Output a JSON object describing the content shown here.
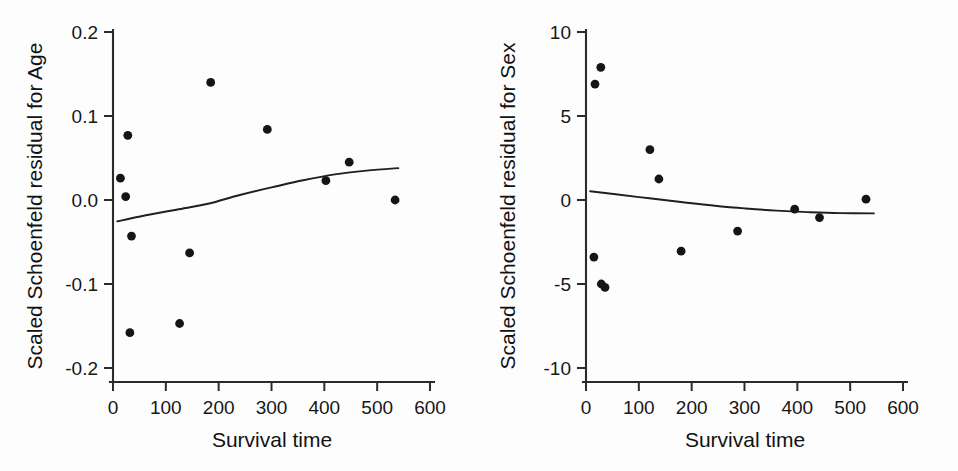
{
  "figure": {
    "background_color": "#fdfdfd",
    "ink_color": "#151515",
    "panel_count": 2
  },
  "chart_data": [
    {
      "type": "scatter",
      "panel": "left",
      "title": "",
      "xlabel": "Survival time",
      "ylabel": "Scaled Schoenfeld residual for Age",
      "xlim": [
        0,
        600
      ],
      "ylim": [
        -0.2,
        0.2
      ],
      "xticks": [
        0,
        100,
        200,
        300,
        400,
        500,
        600
      ],
      "xticklabels": [
        "0",
        "100",
        "200",
        "300",
        "400",
        "500",
        "600"
      ],
      "yticks": [
        -0.2,
        -0.1,
        0.0,
        0.1,
        0.2
      ],
      "yticklabels": [
        "-0.2",
        "-0.1",
        "0.0",
        "0.1",
        "0.2"
      ],
      "grid": false,
      "legend": false,
      "marker": "filled-circle",
      "points": [
        {
          "x": 14,
          "y": 0.026
        },
        {
          "x": 24,
          "y": 0.004
        },
        {
          "x": 28,
          "y": 0.077
        },
        {
          "x": 32,
          "y": -0.158
        },
        {
          "x": 35,
          "y": -0.043
        },
        {
          "x": 126,
          "y": -0.147
        },
        {
          "x": 145,
          "y": -0.063
        },
        {
          "x": 185,
          "y": 0.14
        },
        {
          "x": 292,
          "y": 0.084
        },
        {
          "x": 403,
          "y": 0.023
        },
        {
          "x": 447,
          "y": 0.045
        },
        {
          "x": 534,
          "y": 0.0
        }
      ],
      "fit_curve": [
        {
          "x": 8,
          "y": -0.0255
        },
        {
          "x": 60,
          "y": -0.0185
        },
        {
          "x": 120,
          "y": -0.0115
        },
        {
          "x": 180,
          "y": -0.0045
        },
        {
          "x": 240,
          "y": 0.006
        },
        {
          "x": 300,
          "y": 0.015
        },
        {
          "x": 360,
          "y": 0.0235
        },
        {
          "x": 420,
          "y": 0.0305
        },
        {
          "x": 480,
          "y": 0.035
        },
        {
          "x": 540,
          "y": 0.038
        }
      ]
    },
    {
      "type": "scatter",
      "panel": "right",
      "title": "",
      "xlabel": "Survival time",
      "ylabel": "Scaled Schoenfeld residual for Sex",
      "xlim": [
        0,
        600
      ],
      "ylim": [
        -10,
        10
      ],
      "xticks": [
        0,
        100,
        200,
        300,
        400,
        500,
        600
      ],
      "xticklabels": [
        "0",
        "100",
        "200",
        "300",
        "400",
        "500",
        "600"
      ],
      "yticks": [
        -10,
        -5,
        0,
        5,
        10
      ],
      "yticklabels": [
        "-10",
        "-5",
        "0",
        "5",
        "10"
      ],
      "grid": false,
      "legend": false,
      "marker": "filled-circle",
      "points": [
        {
          "x": 15,
          "y": -3.4
        },
        {
          "x": 17,
          "y": 6.9
        },
        {
          "x": 28,
          "y": 7.9
        },
        {
          "x": 29,
          "y": -5.0
        },
        {
          "x": 36,
          "y": -5.2
        },
        {
          "x": 121,
          "y": 3.0
        },
        {
          "x": 138,
          "y": 1.25
        },
        {
          "x": 180,
          "y": -3.05
        },
        {
          "x": 287,
          "y": -1.85
        },
        {
          "x": 395,
          "y": -0.55
        },
        {
          "x": 442,
          "y": -1.05
        },
        {
          "x": 530,
          "y": 0.05
        }
      ],
      "fit_curve": [
        {
          "x": 8,
          "y": 0.52
        },
        {
          "x": 60,
          "y": 0.33
        },
        {
          "x": 120,
          "y": 0.1
        },
        {
          "x": 180,
          "y": -0.12
        },
        {
          "x": 240,
          "y": -0.33
        },
        {
          "x": 300,
          "y": -0.5
        },
        {
          "x": 360,
          "y": -0.63
        },
        {
          "x": 420,
          "y": -0.72
        },
        {
          "x": 480,
          "y": -0.78
        },
        {
          "x": 545,
          "y": -0.8
        }
      ]
    }
  ]
}
